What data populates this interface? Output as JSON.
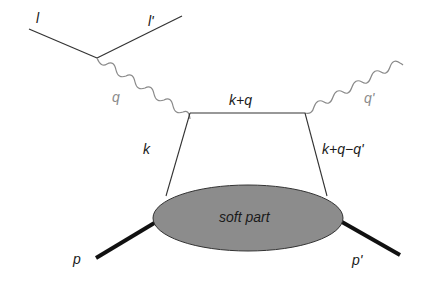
{
  "diagram": {
    "title": "",
    "type": "feynman-diagram",
    "colors": {
      "line": "#333333",
      "photon": "#8a8a8a",
      "blob_fill": "#8c8c8c",
      "hadron_line": "#111111",
      "label_dark": "#1a1a1a",
      "label_grey": "#8a8a8a"
    },
    "labels": {
      "lepton_in": "l",
      "lepton_out": "l'",
      "photon_in": "q",
      "photon_out": "q'",
      "parton_in": "k",
      "propagator": "k+q",
      "parton_out": "k+q−q'",
      "proton_in": "p",
      "proton_out": "p'",
      "blob": "soft part"
    },
    "nodes": [
      {
        "id": "lepton-vertex",
        "x": 97,
        "y": 58
      },
      {
        "id": "left-quark-vertex",
        "x": 190,
        "y": 113
      },
      {
        "id": "right-quark-vertex",
        "x": 305,
        "y": 113
      }
    ],
    "edges": [
      {
        "from": "l",
        "to": "lepton-vertex",
        "style": "solid",
        "label": "l"
      },
      {
        "from": "lepton-vertex",
        "to": "l'",
        "style": "solid",
        "label": "l'"
      },
      {
        "from": "lepton-vertex",
        "to": "left-quark-vertex",
        "style": "wavy",
        "label": "q"
      },
      {
        "from": "left-quark-vertex",
        "to": "right-quark-vertex",
        "style": "solid",
        "label": "k+q"
      },
      {
        "from": "right-quark-vertex",
        "to": "q'",
        "style": "wavy",
        "label": "q'"
      },
      {
        "from": "soft-part",
        "to": "left-quark-vertex",
        "style": "solid",
        "label": "k"
      },
      {
        "from": "right-quark-vertex",
        "to": "soft-part",
        "style": "solid",
        "label": "k+q−q'"
      },
      {
        "from": "p",
        "to": "soft-part",
        "style": "thick",
        "label": "p"
      },
      {
        "from": "soft-part",
        "to": "p'",
        "style": "thick",
        "label": "p'"
      }
    ]
  }
}
